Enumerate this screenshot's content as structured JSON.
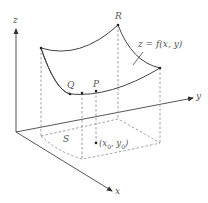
{
  "diagram": {
    "type": "3d-surface-over-region",
    "colors": {
      "line": "#444444",
      "dashed": "#888888",
      "text": "#555555"
    },
    "axes": {
      "x": {
        "label": "x"
      },
      "y": {
        "label": "y"
      },
      "z": {
        "label": "z"
      }
    },
    "surface": {
      "equation_label": "z = f(x, y)"
    },
    "points": {
      "R": {
        "label": "R"
      },
      "Q": {
        "label": "Q"
      },
      "P": {
        "label": "P"
      }
    },
    "region": {
      "label": "S"
    },
    "base_point": {
      "label_x": "x",
      "sub_x": "0",
      "label_y": "y",
      "sub_y": "0"
    }
  }
}
